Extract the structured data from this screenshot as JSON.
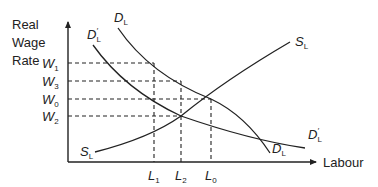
{
  "diagram": {
    "y_axis": {
      "label_lines": [
        "Real",
        "Wage",
        "Rate"
      ]
    },
    "x_axis": {
      "label": "Labour"
    },
    "wage_levels": [
      {
        "id": "W1",
        "symbol": "W",
        "sub": "1"
      },
      {
        "id": "W3",
        "symbol": "W",
        "sub": "3"
      },
      {
        "id": "W0",
        "symbol": "W",
        "sub": "0"
      },
      {
        "id": "W2",
        "symbol": "W",
        "sub": "2"
      }
    ],
    "labour_levels": [
      {
        "id": "L1",
        "symbol": "L",
        "sub": "1"
      },
      {
        "id": "L2",
        "symbol": "L",
        "sub": "2"
      },
      {
        "id": "L0",
        "symbol": "L",
        "sub": "0"
      }
    ],
    "curves": {
      "demand": {
        "symbol": "D",
        "sub": "L"
      },
      "demand_shifted": {
        "symbol": "D",
        "sub": "L",
        "prime": "′"
      },
      "supply": {
        "symbol": "S",
        "sub": "L"
      }
    }
  }
}
